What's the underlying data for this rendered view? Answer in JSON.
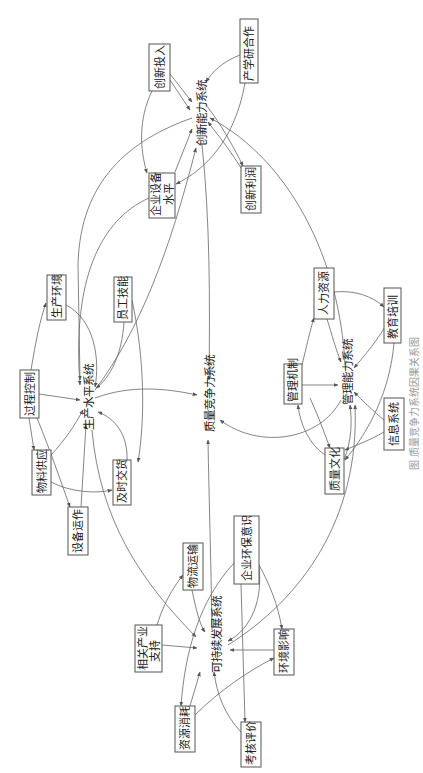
{
  "figure": {
    "orientation": "rotated-90-ccw",
    "caption": "图 质量竞争力系统因果关系图"
  },
  "systems": {
    "center": "质量竞争力系统",
    "innovation": "创新能力系统",
    "production": "生产水平系统",
    "management": "管理能力系统",
    "sustainable": "可持续发展系统"
  },
  "nodes": {
    "innovation_input": "创新投入",
    "industry_univ_research": "产学研合作",
    "equipment_level_1": "企业设备",
    "equipment_level_2": "水平",
    "innovation_profit": "创新利润",
    "production_env": "生产环境",
    "staff_skill": "员工技能",
    "process_control": "过程控制",
    "material_supply": "物料供应",
    "on_time_delivery": "及时交货",
    "equipment_operation": "设备运作",
    "management_mechanism": "管理机制",
    "human_resources": "人力资源",
    "education_training": "教育培训",
    "quality_culture": "质量文化",
    "info_system": "信息系统",
    "logistics": "物流运输",
    "env_awareness": "企业环保意识",
    "related_industry_1": "相关产业",
    "related_industry_2": "支持",
    "env_impact": "环境影响",
    "resource_consumption": "资源消耗",
    "assessment": "考核评价"
  },
  "colors": {
    "line": "#666666",
    "box_border": "#555555",
    "text": "#222222"
  }
}
